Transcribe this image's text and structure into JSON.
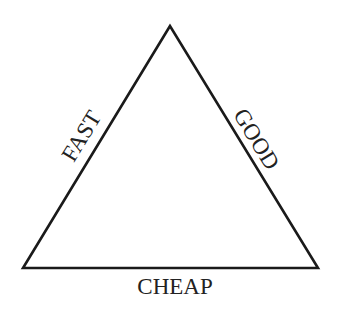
{
  "diagram": {
    "type": "project-management-triangle",
    "edges": {
      "left": "FAST",
      "right": "GOOD",
      "bottom": "CHEAP"
    },
    "colors": {
      "line": "#1a1a1a",
      "text": "#222222",
      "background": "#ffffff"
    }
  }
}
